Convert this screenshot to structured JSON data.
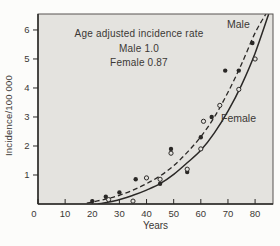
{
  "figure": {
    "background": "#fcfcfa",
    "plot_background": "#e4e3df",
    "ink": "#2a2826",
    "text_color": "#3b3835"
  },
  "chart_data": {
    "type": "scatter",
    "title": "",
    "xlabel": "Years",
    "ylabel": "Incidence/100 000",
    "xlim": [
      0,
      86.6
    ],
    "ylim": [
      0,
      6.55
    ],
    "x_ticks": [
      0,
      10,
      20,
      30,
      40,
      50,
      60,
      70,
      80
    ],
    "y_ticks": [
      1,
      2,
      3,
      4,
      5,
      6
    ],
    "grid": false,
    "legend_position": "none",
    "annotation": {
      "lines": [
        "Age adjusted incidence rate",
        "Male 1.0",
        "Female 0.87"
      ]
    },
    "series": [
      {
        "name": "Male",
        "label": "Male",
        "marker": "filled-circle",
        "line_style": "dashed",
        "points": [
          [
            20,
            0.1
          ],
          [
            25,
            0.25
          ],
          [
            30,
            0.4
          ],
          [
            36,
            0.85
          ],
          [
            45,
            0.7
          ],
          [
            49,
            1.9
          ],
          [
            55,
            1.1
          ],
          [
            60,
            2.3
          ],
          [
            64,
            3.0
          ],
          [
            69,
            4.6
          ],
          [
            74,
            4.6
          ],
          [
            79,
            5.55
          ]
        ],
        "trend": [
          [
            18,
            0.03
          ],
          [
            25,
            0.17
          ],
          [
            30,
            0.3
          ],
          [
            35,
            0.48
          ],
          [
            40,
            0.7
          ],
          [
            45,
            0.97
          ],
          [
            50,
            1.32
          ],
          [
            55,
            1.78
          ],
          [
            60,
            2.32
          ],
          [
            65,
            3.0
          ],
          [
            70,
            3.85
          ],
          [
            75,
            4.82
          ],
          [
            80,
            5.9
          ],
          [
            84,
            6.55
          ]
        ]
      },
      {
        "name": "Female",
        "label": "Female",
        "marker": "open-circle",
        "line_style": "solid",
        "points": [
          [
            26,
            0.15
          ],
          [
            35,
            0.1
          ],
          [
            40,
            0.9
          ],
          [
            45,
            0.85
          ],
          [
            49,
            1.75
          ],
          [
            55,
            1.2
          ],
          [
            60,
            1.9
          ],
          [
            61,
            2.85
          ],
          [
            67,
            3.4
          ],
          [
            74,
            3.95
          ],
          [
            80,
            5.0
          ]
        ],
        "trend": [
          [
            22,
            0.0
          ],
          [
            28,
            0.1
          ],
          [
            35,
            0.3
          ],
          [
            40,
            0.48
          ],
          [
            45,
            0.7
          ],
          [
            50,
            1.02
          ],
          [
            55,
            1.42
          ],
          [
            60,
            1.85
          ],
          [
            65,
            2.45
          ],
          [
            70,
            3.2
          ],
          [
            75,
            4.1
          ],
          [
            80,
            5.2
          ],
          [
            85,
            6.55
          ]
        ]
      }
    ]
  }
}
